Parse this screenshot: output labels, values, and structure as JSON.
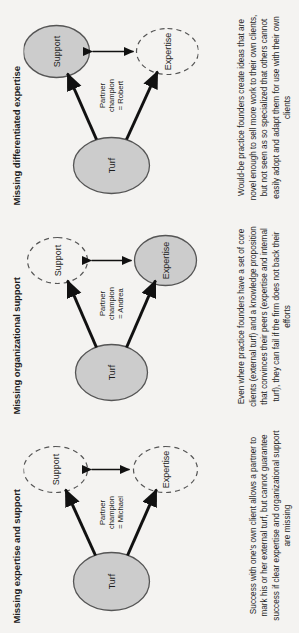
{
  "figure": {
    "orientation": "rotated-90-ccw",
    "background_color": "#f4f3f1",
    "node_fill_color": "#cccccc",
    "node_stroke_color": "#555555",
    "text_color": "#1d1d1d"
  },
  "panels": [
    {
      "id": "missing-expertise-and-support",
      "title": "Missing expertise and support",
      "nodes": {
        "turf": {
          "label": "Turf",
          "style": "solid"
        },
        "support": {
          "label": "Support",
          "style": "dashed"
        },
        "expertise": {
          "label": "Expertise",
          "style": "dashed"
        }
      },
      "edge_label": "Partner\nchampion\n= Michael",
      "champion_name": "Michael",
      "caption": "Success with one's own client allows a partner to mark his or her external turf, but cannot guarantee success if clear expertise and organizational support are missing"
    },
    {
      "id": "missing-organizational-support",
      "title": "Missing organizational support",
      "nodes": {
        "turf": {
          "label": "Turf",
          "style": "solid"
        },
        "support": {
          "label": "Support",
          "style": "dashed"
        },
        "expertise": {
          "label": "Expertise",
          "style": "solid"
        }
      },
      "edge_label": "Partner\nchampion\n= Andrea",
      "champion_name": "Andrea",
      "caption": "Even where practice founders have a set of core clients (external turf) and a knowledge proposition that convinces their peers (expertise and internal turf), they can fail if the firm does not back their efforts"
    },
    {
      "id": "missing-differentiated-expertise",
      "title": "Missing differentiated expertise",
      "nodes": {
        "turf": {
          "label": "Turf",
          "style": "solid"
        },
        "support": {
          "label": "Support",
          "style": "solid"
        },
        "expertise": {
          "label": "Expertise",
          "style": "dashed"
        }
      },
      "edge_label": "Partner\nchampion\n= Robert",
      "champion_name": "Robert",
      "caption": "Would-be practice founders create ideas that are novel enough to sell more work to their own clients, but not seen as so specialized that others cannot easily adopt and adapt them for use with their own clients"
    }
  ]
}
